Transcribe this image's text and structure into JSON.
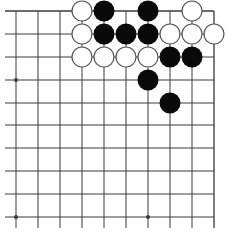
{
  "board": {
    "type": "go-diagram-fragment",
    "columns_x": [
      16,
      38,
      60,
      82,
      104,
      126,
      148,
      170,
      192,
      214
    ],
    "rows_y": [
      11,
      34,
      57,
      80,
      103,
      125,
      148,
      171,
      194,
      217
    ],
    "line_color": "#3a3a3a",
    "black_color": "#0a0a0a",
    "white_fill": "#ffffff",
    "white_stroke": "#555555",
    "stone_radius": 10.5,
    "star_points": [
      [
        0,
        3
      ],
      [
        0,
        9
      ],
      [
        6,
        9
      ]
    ],
    "stones": [
      {
        "col": 3,
        "row": 0,
        "color": "white"
      },
      {
        "col": 4,
        "row": 0,
        "color": "black"
      },
      {
        "col": 6,
        "row": 0,
        "color": "black"
      },
      {
        "col": 8,
        "row": 0,
        "color": "white"
      },
      {
        "col": 3,
        "row": 1,
        "color": "white"
      },
      {
        "col": 4,
        "row": 1,
        "color": "black"
      },
      {
        "col": 5,
        "row": 1,
        "color": "black"
      },
      {
        "col": 6,
        "row": 1,
        "color": "black"
      },
      {
        "col": 7,
        "row": 1,
        "color": "white"
      },
      {
        "col": 8,
        "row": 1,
        "color": "white"
      },
      {
        "col": 9,
        "row": 1,
        "color": "white"
      },
      {
        "col": 3,
        "row": 2,
        "color": "white"
      },
      {
        "col": 4,
        "row": 2,
        "color": "white"
      },
      {
        "col": 5,
        "row": 2,
        "color": "white"
      },
      {
        "col": 6,
        "row": 2,
        "color": "white"
      },
      {
        "col": 7,
        "row": 2,
        "color": "black"
      },
      {
        "col": 8,
        "row": 2,
        "color": "black"
      },
      {
        "col": 6,
        "row": 3,
        "color": "black"
      },
      {
        "col": 7,
        "row": 4,
        "color": "black"
      }
    ]
  },
  "caption": {
    "text": ""
  }
}
